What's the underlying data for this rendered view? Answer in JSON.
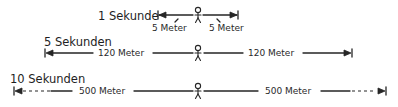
{
  "rows": [
    {
      "title": "1 Sekunde",
      "left_label": "5 Meter",
      "right_label": "5 Meter"
    },
    {
      "title": "5 Sekunden",
      "left_label": "120 Meter",
      "right_label": "120 Meter"
    },
    {
      "title": "10 Sekunden",
      "left_label": "500 Meter",
      "right_label": "500 Meter"
    }
  ],
  "icons": {
    "person": "stick-figure-icon",
    "arrowhead": "arrow-end-bar-icon"
  },
  "colors": {
    "ink": "#262626",
    "background": "#ffffff"
  }
}
